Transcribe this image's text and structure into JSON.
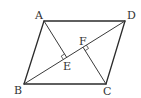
{
  "figure": {
    "type": "parallelogram with diagonal and perpendiculars",
    "points": {
      "A": {
        "label": "A",
        "x": 44,
        "y": 21
      },
      "B": {
        "label": "B",
        "x": 24,
        "y": 84
      },
      "C": {
        "label": "C",
        "x": 106,
        "y": 84
      },
      "D": {
        "label": "D",
        "x": 125,
        "y": 21
      },
      "E": {
        "label": "E",
        "x": 66.7,
        "y": 57.4
      },
      "F": {
        "label": "F",
        "x": 83.0,
        "y": 47.2
      }
    },
    "segments": [
      "AB",
      "BC",
      "CD",
      "DA",
      "BD",
      "AE",
      "CF"
    ],
    "right_angles": [
      "AEB",
      "CFD"
    ],
    "colors": {
      "stroke": "#2b2b2b",
      "label": "#333333",
      "background": "#ffffff"
    }
  }
}
